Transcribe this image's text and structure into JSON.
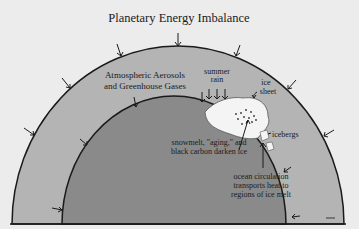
{
  "title": "Planetary Energy Imbalance",
  "labels": {
    "atmosphere_line1": "Atmospheric Aerosols",
    "atmosphere_line2": "and Greenhouse Gases",
    "summer_rain_line1": "summer",
    "summer_rain_line2": "rain",
    "ice_sheet_line1": "ice",
    "ice_sheet_line2": "sheet",
    "icebergs": "icebergs",
    "snowmelt_line1": "snowmelt, \"aging,\" and",
    "snowmelt_line2": "black carbon darken ice",
    "ocean_line1": "ocean circulation",
    "ocean_line2": "transports heat to",
    "ocean_line3": "regions of ice melt"
  },
  "colors": {
    "background": "#ececec",
    "atmosphere": "#b4b4b4",
    "earth": "#8a8a8a",
    "ice": "#f4f4f4",
    "outline": "#1a1a1a"
  }
}
